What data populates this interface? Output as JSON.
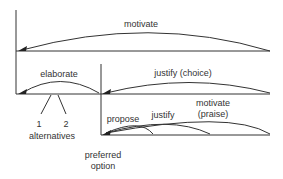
{
  "diagram": {
    "type": "rhetorical-structure",
    "relations": [
      {
        "id": "motivate",
        "label": "motivate"
      },
      {
        "id": "elaborate",
        "label": "elaborate"
      },
      {
        "id": "justify-choice",
        "label": "justify (choice)"
      },
      {
        "id": "propose",
        "label": "propose"
      },
      {
        "id": "justify",
        "label": "justify"
      },
      {
        "id": "motivate-praise",
        "label_line1": "motivate",
        "label_line2": "(praise)"
      }
    ],
    "nodes": {
      "alt1": "1",
      "alt2": "2",
      "alternatives": "alternatives",
      "preferred_line1": "preferred",
      "preferred_line2": "option"
    }
  }
}
